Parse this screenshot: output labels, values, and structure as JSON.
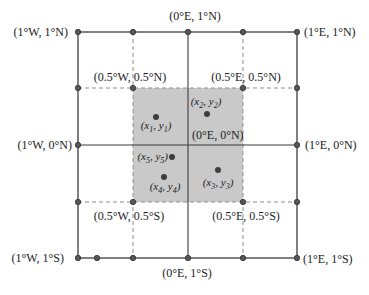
{
  "figure": {
    "width": 369,
    "height": 295,
    "colors": {
      "background": "#ffffff",
      "solid_line": "#3d3d3d",
      "dashed_line": "#8f8f8f",
      "shaded_region": "#c9c9c9",
      "node_dot_fill": "#575757",
      "node_dot_stroke": "#303030",
      "point_dot": "#3e3e3e",
      "text": "#1c1c1c"
    },
    "outer_square": {
      "x1": 78,
      "y1": 32,
      "x2": 297,
      "y2": 258
    },
    "center_lines": {
      "vertical_x": 188,
      "horizontal_y": 145
    },
    "dashed_lines": {
      "vertical_x": [
        133,
        243
      ],
      "horizontal_y": [
        88,
        202
      ]
    },
    "shaded_square": {
      "x1": 133,
      "y1": 88,
      "x2": 243,
      "y2": 202
    },
    "grid_nodes": [
      {
        "x": 78,
        "y": 32
      },
      {
        "x": 133,
        "y": 32
      },
      {
        "x": 188,
        "y": 32
      },
      {
        "x": 243,
        "y": 32
      },
      {
        "x": 297,
        "y": 32
      },
      {
        "x": 78,
        "y": 88
      },
      {
        "x": 133,
        "y": 88
      },
      {
        "x": 243,
        "y": 88
      },
      {
        "x": 297,
        "y": 88
      },
      {
        "x": 78,
        "y": 145
      },
      {
        "x": 297,
        "y": 145
      },
      {
        "x": 78,
        "y": 202
      },
      {
        "x": 133,
        "y": 202
      },
      {
        "x": 243,
        "y": 202
      },
      {
        "x": 297,
        "y": 202
      },
      {
        "x": 78,
        "y": 258
      },
      {
        "x": 97,
        "y": 258
      },
      {
        "x": 133,
        "y": 258
      },
      {
        "x": 188,
        "y": 258
      },
      {
        "x": 243,
        "y": 258
      },
      {
        "x": 297,
        "y": 258
      }
    ],
    "coordinate_labels": [
      {
        "name": "label-0e-1n",
        "text": "(0°E, 1°N)",
        "x": 195,
        "y": 20,
        "anchor": "middle"
      },
      {
        "name": "label-1w-1n",
        "text": "(1°W, 1°N)",
        "x": 68,
        "y": 36,
        "anchor": "end"
      },
      {
        "name": "label-1e-1n",
        "text": "(1°E, 1°N)",
        "x": 304,
        "y": 36,
        "anchor": "start"
      },
      {
        "name": "label-05w-05n",
        "text": "(0.5°W, 0.5°N)",
        "x": 130,
        "y": 81,
        "anchor": "middle"
      },
      {
        "name": "label-05e-05n",
        "text": "(0.5°E, 0.5°N)",
        "x": 246,
        "y": 81,
        "anchor": "middle"
      },
      {
        "name": "label-1w-0n",
        "text": "(1°W, 0°N)",
        "x": 72,
        "y": 149,
        "anchor": "end"
      },
      {
        "name": "label-0e-0n",
        "text": "(0°E, 0°N)",
        "x": 192,
        "y": 139,
        "anchor": "start"
      },
      {
        "name": "label-1e-0n",
        "text": "(1°E, 0°N)",
        "x": 305,
        "y": 149,
        "anchor": "start"
      },
      {
        "name": "label-05w-05s",
        "text": "(0.5°W, 0.5°S)",
        "x": 129,
        "y": 220,
        "anchor": "middle"
      },
      {
        "name": "label-05e-05s",
        "text": "(0.5°E, 0.5°S)",
        "x": 246,
        "y": 220,
        "anchor": "middle"
      },
      {
        "name": "label-1w-1s",
        "text": "(1°W, 1°S)",
        "x": 64,
        "y": 262,
        "anchor": "end"
      },
      {
        "name": "label-1e-1s",
        "text": "(1°E, 1°S)",
        "x": 303,
        "y": 263,
        "anchor": "start"
      },
      {
        "name": "label-0e-1s",
        "text": "(0°E, 1°S)",
        "x": 187,
        "y": 277,
        "anchor": "middle"
      }
    ],
    "data_points": [
      {
        "name": "point-1",
        "dot": {
          "x": 156,
          "y": 117
        },
        "label": {
          "x_var": "x",
          "x_sub": "1",
          "y_var": "y",
          "y_sub": "1"
        },
        "label_pos": {
          "x": 156,
          "y": 129,
          "anchor": "middle"
        }
      },
      {
        "name": "point-2",
        "dot": {
          "x": 207,
          "y": 114
        },
        "label": {
          "x_var": "x",
          "x_sub": "2",
          "y_var": "y",
          "y_sub": "2"
        },
        "label_pos": {
          "x": 206,
          "y": 105,
          "anchor": "middle"
        }
      },
      {
        "name": "point-3",
        "dot": {
          "x": 218,
          "y": 170
        },
        "label": {
          "x_var": "x",
          "x_sub": "3",
          "y_var": "y",
          "y_sub": "3"
        },
        "label_pos": {
          "x": 218,
          "y": 186,
          "anchor": "middle"
        }
      },
      {
        "name": "point-4",
        "dot": {
          "x": 164,
          "y": 177
        },
        "label": {
          "x_var": "x",
          "x_sub": "4",
          "y_var": "y",
          "y_sub": "4"
        },
        "label_pos": {
          "x": 165,
          "y": 190,
          "anchor": "middle"
        }
      },
      {
        "name": "point-5",
        "dot": {
          "x": 172,
          "y": 157
        },
        "label": {
          "x_var": "x",
          "x_sub": "5",
          "y_var": "y",
          "y_sub": "5"
        },
        "label_pos": {
          "x": 168,
          "y": 160,
          "anchor": "end"
        }
      }
    ]
  }
}
